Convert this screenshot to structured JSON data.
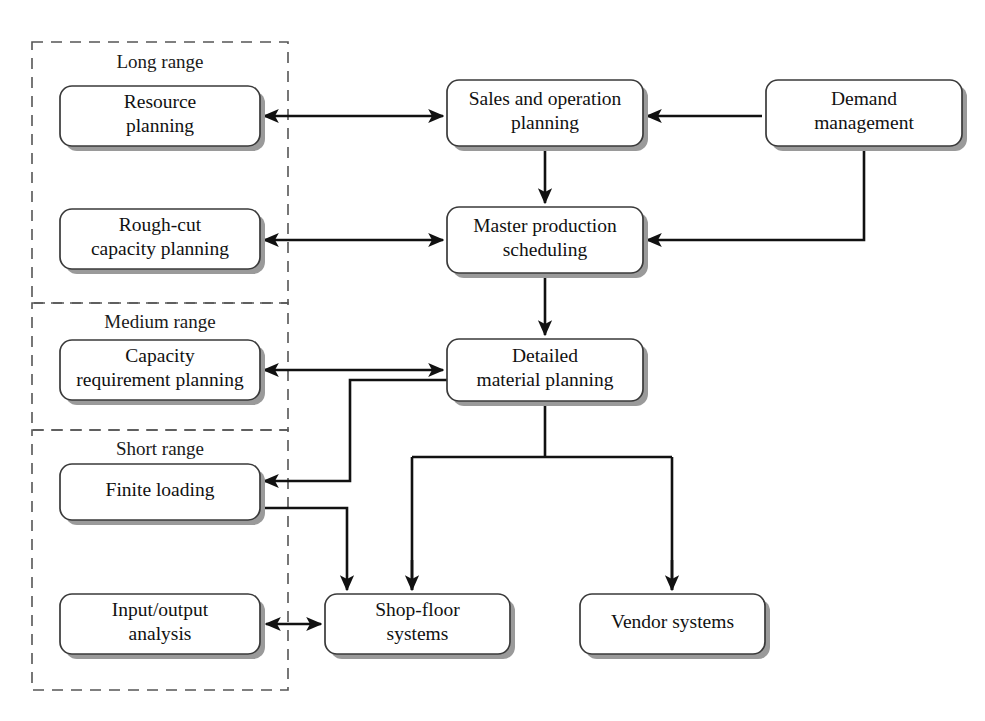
{
  "diagram": {
    "canvas": {
      "width": 985,
      "height": 721
    },
    "style": {
      "box_fill": "#ffffff",
      "box_stroke": "#3a3a3a",
      "box_shadow": "#9a9a9a",
      "panel_stroke": "#555555",
      "connector_stroke": "#111111",
      "text_color": "#111111"
    },
    "panels": [
      {
        "id": "long-range",
        "label": "Long range",
        "x": 32,
        "y": 42,
        "w": 256,
        "h": 261,
        "label_x": 160,
        "label_y": 68
      },
      {
        "id": "medium-range",
        "label": "Medium range",
        "x": 32,
        "y": 303,
        "w": 256,
        "h": 127,
        "label_x": 160,
        "label_y": 328
      },
      {
        "id": "short-range",
        "label": "Short range",
        "x": 32,
        "y": 430,
        "w": 256,
        "h": 260,
        "label_x": 160,
        "label_y": 455
      }
    ],
    "nodes": [
      {
        "id": "resource-planning",
        "lines": [
          "Resource",
          "planning"
        ],
        "x": 60,
        "y": 86,
        "w": 200,
        "h": 60
      },
      {
        "id": "sales-and-operation-planning",
        "lines": [
          "Sales and operation",
          "planning"
        ],
        "x": 447,
        "y": 80,
        "w": 196,
        "h": 66
      },
      {
        "id": "demand-management",
        "lines": [
          "Demand",
          "management"
        ],
        "x": 766,
        "y": 80,
        "w": 196,
        "h": 66
      },
      {
        "id": "rough-cut-capacity-planning",
        "lines": [
          "Rough-cut",
          "capacity planning"
        ],
        "x": 60,
        "y": 209,
        "w": 200,
        "h": 60
      },
      {
        "id": "master-production-scheduling",
        "lines": [
          "Master production",
          "scheduling"
        ],
        "x": 447,
        "y": 207,
        "w": 196,
        "h": 66
      },
      {
        "id": "capacity-requirement-planning",
        "lines": [
          "Capacity",
          "requirement planning"
        ],
        "x": 60,
        "y": 340,
        "w": 200,
        "h": 60
      },
      {
        "id": "detailed-material-planning",
        "lines": [
          "Detailed",
          "material planning"
        ],
        "x": 447,
        "y": 339,
        "w": 196,
        "h": 62
      },
      {
        "id": "finite-loading",
        "lines": [
          "Finite loading"
        ],
        "x": 60,
        "y": 464,
        "w": 200,
        "h": 56
      },
      {
        "id": "input-output-analysis",
        "lines": [
          "Input/output",
          "analysis"
        ],
        "x": 60,
        "y": 594,
        "w": 200,
        "h": 60
      },
      {
        "id": "shop-floor-systems",
        "lines": [
          "Shop-floor",
          "systems"
        ],
        "x": 325,
        "y": 594,
        "w": 185,
        "h": 60
      },
      {
        "id": "vendor-systems",
        "lines": [
          "Vendor systems"
        ],
        "x": 580,
        "y": 594,
        "w": 185,
        "h": 60
      }
    ],
    "connectors": [
      {
        "id": "resource-planning-to-sales-and-operation-planning",
        "path": "M 264 116 L 443 116",
        "arrow_start": true,
        "arrow_end": true
      },
      {
        "id": "demand-management-to-sales-and-operation-planning",
        "path": "M 762 116 L 647 116",
        "arrow_start": false,
        "arrow_end": true
      },
      {
        "id": "sales-and-operation-planning-to-master-production-scheduling",
        "path": "M 545 150 L 545 203",
        "arrow_start": false,
        "arrow_end": true
      },
      {
        "id": "rough-cut-capacity-planning-to-master-production-scheduling",
        "path": "M 264 240 L 443 240",
        "arrow_start": true,
        "arrow_end": true
      },
      {
        "id": "demand-management-to-master-production-scheduling",
        "path": "M 864 150 L 864 240 L 647 240",
        "arrow_start": false,
        "arrow_end": true
      },
      {
        "id": "master-production-scheduling-to-detailed-material-planning",
        "path": "M 545 277 L 545 335",
        "arrow_start": false,
        "arrow_end": true
      },
      {
        "id": "capacity-requirement-planning-to-detailed-material-planning",
        "path": "M 264 370 L 443 370",
        "arrow_start": true,
        "arrow_end": true
      },
      {
        "id": "detailed-material-planning-to-finite-loading",
        "path": "M 447 380 L 350 380 L 350 481 L 264 481",
        "arrow_start": false,
        "arrow_end": true
      },
      {
        "id": "finite-loading-to-shop-floor-systems",
        "path": "M 260 508 L 347 508 L 347 590",
        "arrow_start": false,
        "arrow_end": true
      },
      {
        "id": "detailed-material-planning-bus",
        "path": "M 545 405 L 545 457 M 412 457 L 672 457 M 412 457 L 412 590 M 672 457 L 672 590",
        "arrow_start": false,
        "arrow_end": false
      },
      {
        "id": "bus-to-shop-floor-systems",
        "path": "M 412 560 L 412 590",
        "arrow_start": false,
        "arrow_end": true
      },
      {
        "id": "bus-to-vendor-systems",
        "path": "M 672 560 L 672 590",
        "arrow_start": false,
        "arrow_end": true
      },
      {
        "id": "input-output-analysis-to-shop-floor-systems",
        "path": "M 266 624 L 321 624",
        "arrow_start": true,
        "arrow_end": true
      }
    ]
  }
}
